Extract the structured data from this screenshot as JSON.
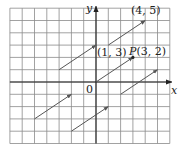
{
  "figure": {
    "axes": {
      "x_label": "x",
      "y_label": "y",
      "origin_label": "0"
    },
    "grid": {
      "x_min": -7,
      "x_max": 6,
      "y_min": -5,
      "y_max": 6,
      "cell_px": 12.3,
      "origin_px": [
        96,
        82
      ]
    },
    "points": [
      {
        "label": "(4, 5)",
        "x": 4,
        "y": 5
      },
      {
        "label": "(1, 3)",
        "x": 1,
        "y": 3
      },
      {
        "label": "P(3, 2)",
        "name": "P",
        "x": 3,
        "y": 2
      }
    ],
    "vectors": [
      {
        "from": [
          0,
          0
        ],
        "to": [
          3,
          2
        ]
      },
      {
        "from": [
          1,
          3
        ],
        "to": [
          4,
          5
        ]
      },
      {
        "from": [
          -3,
          1
        ],
        "to": [
          0,
          3
        ]
      },
      {
        "from": [
          -5,
          -3
        ],
        "to": [
          -2,
          -1
        ]
      },
      {
        "from": [
          -2,
          -4
        ],
        "to": [
          1,
          -2
        ]
      },
      {
        "from": [
          2,
          -1
        ],
        "to": [
          5,
          1
        ]
      }
    ],
    "colors": {
      "grid": "#8a8a8a",
      "axis": "#222222",
      "vector": "#555555"
    }
  }
}
